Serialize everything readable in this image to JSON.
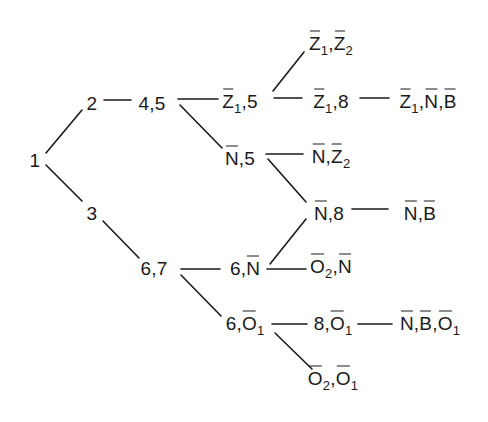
{
  "diagram": {
    "type": "tree",
    "nodes": [
      {
        "id": "n1",
        "x": 35,
        "y": 160,
        "parts": [
          {
            "t": "1"
          }
        ]
      },
      {
        "id": "n2",
        "x": 92,
        "y": 103,
        "parts": [
          {
            "t": "2"
          }
        ]
      },
      {
        "id": "n3",
        "x": 92,
        "y": 213,
        "parts": [
          {
            "t": "3"
          }
        ]
      },
      {
        "id": "n45",
        "x": 152,
        "y": 103,
        "parts": [
          {
            "t": "4,5"
          }
        ]
      },
      {
        "id": "n67",
        "x": 154,
        "y": 268,
        "parts": [
          {
            "t": "6,7"
          }
        ]
      },
      {
        "id": "nZ15",
        "x": 240,
        "y": 103,
        "parts": [
          {
            "t": "Z",
            "bar": true,
            "sub": "1"
          },
          {
            "t": ",5"
          }
        ]
      },
      {
        "id": "nN5",
        "x": 240,
        "y": 158,
        "parts": [
          {
            "t": "N",
            "bar": true
          },
          {
            "t": ",5"
          }
        ]
      },
      {
        "id": "nZ1Z2",
        "x": 331,
        "y": 45,
        "parts": [
          {
            "t": "Z",
            "bar": true,
            "sub": "1"
          },
          {
            "t": ","
          },
          {
            "t": "Z",
            "bar": true,
            "sub": "2"
          }
        ]
      },
      {
        "id": "nZ18",
        "x": 331,
        "y": 103,
        "parts": [
          {
            "t": "Z",
            "bar": true,
            "sub": "1"
          },
          {
            "t": ",8"
          }
        ]
      },
      {
        "id": "nZ1NB",
        "x": 428,
        "y": 103,
        "parts": [
          {
            "t": "Z",
            "bar": true,
            "sub": "1"
          },
          {
            "t": ","
          },
          {
            "t": "N",
            "bar": true
          },
          {
            "t": ","
          },
          {
            "t": "B",
            "bar": true
          }
        ]
      },
      {
        "id": "nNZ2",
        "x": 331,
        "y": 158,
        "parts": [
          {
            "t": "N",
            "bar": true
          },
          {
            "t": ","
          },
          {
            "t": "Z",
            "bar": true,
            "sub": "2"
          }
        ]
      },
      {
        "id": "nN8",
        "x": 329,
        "y": 213,
        "parts": [
          {
            "t": "N",
            "bar": true
          },
          {
            "t": ",8"
          }
        ]
      },
      {
        "id": "nNB",
        "x": 420,
        "y": 213,
        "parts": [
          {
            "t": "N",
            "bar": true
          },
          {
            "t": ","
          },
          {
            "t": "B",
            "bar": true
          }
        ]
      },
      {
        "id": "n6N",
        "x": 245,
        "y": 268,
        "parts": [
          {
            "t": "6,"
          },
          {
            "t": "N",
            "bar": true
          }
        ]
      },
      {
        "id": "nO2N",
        "x": 331,
        "y": 268,
        "parts": [
          {
            "t": "O",
            "bar": true,
            "sub": "2"
          },
          {
            "t": ","
          },
          {
            "t": "N",
            "bar": true
          }
        ]
      },
      {
        "id": "n6O1",
        "x": 245,
        "y": 325,
        "parts": [
          {
            "t": "6,"
          },
          {
            "t": "O",
            "bar": true,
            "sub": "1"
          }
        ]
      },
      {
        "id": "n8O1",
        "x": 333,
        "y": 325,
        "parts": [
          {
            "t": "8,"
          },
          {
            "t": "O",
            "bar": true,
            "sub": "1"
          }
        ]
      },
      {
        "id": "nNBO1",
        "x": 430,
        "y": 325,
        "parts": [
          {
            "t": "N",
            "bar": true
          },
          {
            "t": ","
          },
          {
            "t": "B",
            "bar": true
          },
          {
            "t": ","
          },
          {
            "t": "O",
            "bar": true,
            "sub": "1"
          }
        ]
      },
      {
        "id": "nO2O1",
        "x": 333,
        "y": 380,
        "parts": [
          {
            "t": "O",
            "bar": true,
            "sub": "2"
          },
          {
            "t": ","
          },
          {
            "t": "O",
            "bar": true,
            "sub": "1"
          }
        ]
      }
    ],
    "edges": [
      {
        "from": "n1",
        "to": "n2",
        "x1": 46,
        "y1": 153,
        "x2": 82,
        "y2": 110
      },
      {
        "from": "n1",
        "to": "n3",
        "x1": 46,
        "y1": 165,
        "x2": 82,
        "y2": 201
      },
      {
        "from": "n2",
        "to": "n45",
        "x1": 104,
        "y1": 100,
        "x2": 131,
        "y2": 100
      },
      {
        "from": "n3",
        "to": "n67",
        "x1": 103,
        "y1": 221,
        "x2": 139,
        "y2": 258
      },
      {
        "from": "n45",
        "to": "nZ15",
        "x1": 178,
        "y1": 99,
        "x2": 218,
        "y2": 99
      },
      {
        "from": "n45",
        "to": "nN5",
        "x1": 180,
        "y1": 105,
        "x2": 222,
        "y2": 148
      },
      {
        "from": "nZ15",
        "to": "nZ1Z2",
        "x1": 273,
        "y1": 91,
        "x2": 304,
        "y2": 52
      },
      {
        "from": "nZ15",
        "to": "nZ18",
        "x1": 274,
        "y1": 98,
        "x2": 302,
        "y2": 98
      },
      {
        "from": "nZ18",
        "to": "nZ1NB",
        "x1": 360,
        "y1": 98,
        "x2": 389,
        "y2": 98
      },
      {
        "from": "nN5",
        "to": "nNZ2",
        "x1": 266,
        "y1": 154,
        "x2": 303,
        "y2": 154
      },
      {
        "from": "nN5",
        "to": "nN8",
        "x1": 268,
        "y1": 159,
        "x2": 306,
        "y2": 202
      },
      {
        "from": "nN8",
        "to": "nNB",
        "x1": 352,
        "y1": 209,
        "x2": 388,
        "y2": 209
      },
      {
        "from": "n67",
        "to": "n6N",
        "x1": 181,
        "y1": 269,
        "x2": 220,
        "y2": 269
      },
      {
        "from": "n6N",
        "to": "nN8",
        "x1": 270,
        "y1": 264,
        "x2": 306,
        "y2": 219
      },
      {
        "from": "n6N",
        "to": "nO2N",
        "x1": 267,
        "y1": 269,
        "x2": 306,
        "y2": 269
      },
      {
        "from": "n67",
        "to": "n6O1",
        "x1": 181,
        "y1": 275,
        "x2": 221,
        "y2": 316
      },
      {
        "from": "n6O1",
        "to": "n8O1",
        "x1": 272,
        "y1": 324,
        "x2": 307,
        "y2": 324
      },
      {
        "from": "n8O1",
        "to": "nNBO1",
        "x1": 358,
        "y1": 324,
        "x2": 392,
        "y2": 324
      },
      {
        "from": "n6O1",
        "to": "nO2O1",
        "x1": 275,
        "y1": 333,
        "x2": 312,
        "y2": 369
      }
    ],
    "colors": {
      "ink": "#1a1a1a",
      "background": "#ffffff"
    }
  }
}
